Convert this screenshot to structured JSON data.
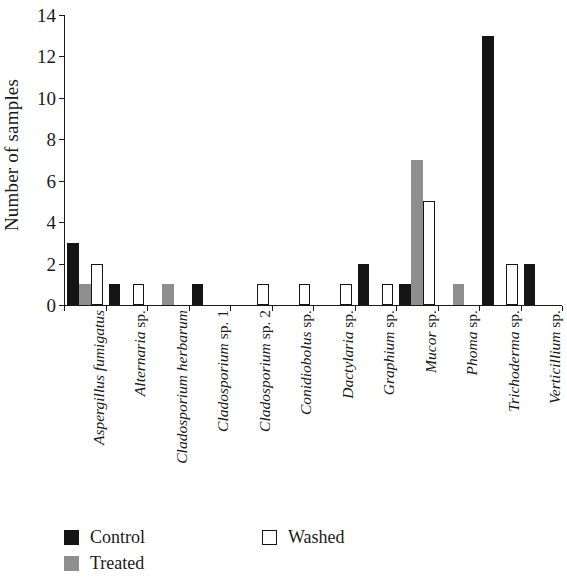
{
  "chart_data": {
    "type": "bar",
    "title": "",
    "subtitle": "",
    "xlabel": "",
    "ylabel": "Number of samples",
    "ylim": [
      0,
      14
    ],
    "yticks": [
      0,
      2,
      4,
      6,
      8,
      10,
      12,
      14
    ],
    "grid": false,
    "legend_position": "bottom-left",
    "orientation": "vertical",
    "grouping": "grouped",
    "categories": [
      "Aspergillus fumigatus",
      "Alternaria sp.",
      "Cladosporium herbarum",
      "Cladosporium sp. 1",
      "Cladosporium sp. 2",
      "Conidiobolus sp.",
      "Dactylaria sp.",
      "Graphium sp.",
      "Mucor sp.",
      "Phoma sp.",
      "Trichoderma sp.",
      "Verticillium sp."
    ],
    "category_italic_parts": [
      "Aspergillus fumigatus",
      "Alternaria",
      "Cladosporium herbarum",
      "Cladosporium",
      "Cladosporium",
      "Conidiobolus",
      "Dactylaria",
      "Graphium",
      "Mucor",
      "Phoma",
      "Trichoderma",
      "Verticillium"
    ],
    "category_roman_parts": [
      "",
      " sp.",
      "",
      " sp. 1",
      " sp. 2",
      " sp.",
      " sp.",
      " sp.",
      " sp.",
      " sp.",
      " sp.",
      " sp."
    ],
    "series": [
      {
        "name": "Control",
        "color": "#151515",
        "style": "solid-black",
        "values": [
          3,
          1,
          0,
          1,
          0,
          0,
          0,
          2,
          1,
          0,
          13,
          2
        ]
      },
      {
        "name": "Treated",
        "color": "#8e8e8e",
        "style": "solid-gray",
        "values": [
          1,
          0,
          1,
          0,
          0,
          0,
          0,
          0,
          7,
          1,
          0,
          0
        ]
      },
      {
        "name": "Washed",
        "color": "#ffffff",
        "style": "open-outline",
        "values": [
          2,
          1,
          0,
          0,
          1,
          1,
          1,
          1,
          5,
          0,
          2,
          0
        ]
      }
    ]
  },
  "axes": {
    "y_title": "Number of samples",
    "y_tick_labels": [
      "0",
      "2",
      "4",
      "6",
      "8",
      "10",
      "12",
      "14"
    ]
  },
  "legend": {
    "entries": [
      {
        "label": "Control",
        "swatch": "black-filled-square"
      },
      {
        "label": "Treated",
        "swatch": "gray-filled-square"
      },
      {
        "label": "Washed",
        "swatch": "open-outline-square"
      }
    ]
  },
  "colors": {
    "control": "#151515",
    "treated": "#8e8e8e",
    "washed": "#ffffff",
    "axis": "#1a1a1a",
    "background": "#ffffff"
  }
}
